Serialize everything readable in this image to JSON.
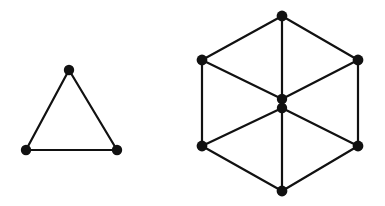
{
  "figure": {
    "background_color": "#ffffff",
    "stroke_color": "#111111",
    "edge_width": 2.2,
    "node_radius": 5.2,
    "width": 385,
    "height": 206
  },
  "graphs": [
    {
      "id": "triangle-graph",
      "name": "triangle",
      "vertex_count": 3,
      "edge_count": 3,
      "nodes": [
        {
          "id": "t-apex",
          "label": "apex",
          "x": 69,
          "y": 70,
          "r": 5.2
        },
        {
          "id": "t-bottom-left",
          "label": "bottom-left",
          "x": 26,
          "y": 150,
          "r": 5.2
        },
        {
          "id": "t-bottom-right",
          "label": "bottom-right",
          "x": 117,
          "y": 150,
          "r": 5.2
        }
      ],
      "edges": [
        {
          "id": "t-e1",
          "from": "t-apex",
          "to": "t-bottom-left",
          "x1": 69,
          "y1": 70,
          "x2": 26,
          "y2": 150
        },
        {
          "id": "t-e2",
          "from": "t-apex",
          "to": "t-bottom-right",
          "x1": 69,
          "y1": 70,
          "x2": 117,
          "y2": 150
        },
        {
          "id": "t-e3",
          "from": "t-bottom-left",
          "to": "t-bottom-right",
          "x1": 26,
          "y1": 150,
          "x2": 117,
          "y2": 150
        }
      ]
    },
    {
      "id": "hexagon-graph",
      "name": "hexagon-with-double-center",
      "vertex_count": 8,
      "edge_count": 13,
      "nodes": [
        {
          "id": "h-top",
          "label": "top",
          "x": 282,
          "y": 16,
          "r": 5.4
        },
        {
          "id": "h-upper-left",
          "label": "upper-left",
          "x": 202,
          "y": 60,
          "r": 5.4
        },
        {
          "id": "h-upper-right",
          "label": "upper-right",
          "x": 358,
          "y": 60,
          "r": 5.4
        },
        {
          "id": "h-center-upper",
          "label": "center-upper",
          "x": 282,
          "y": 99,
          "r": 5.2
        },
        {
          "id": "h-center-lower",
          "label": "center-lower",
          "x": 282,
          "y": 108,
          "r": 5.2
        },
        {
          "id": "h-lower-left",
          "label": "lower-left",
          "x": 202,
          "y": 146,
          "r": 5.4
        },
        {
          "id": "h-lower-right",
          "label": "lower-right",
          "x": 358,
          "y": 146,
          "r": 5.4
        },
        {
          "id": "h-bottom",
          "label": "bottom",
          "x": 282,
          "y": 191,
          "r": 5.4
        }
      ],
      "edges": [
        {
          "id": "h-e1",
          "from": "h-top",
          "to": "h-upper-left",
          "x1": 282,
          "y1": 16,
          "x2": 202,
          "y2": 60
        },
        {
          "id": "h-e2",
          "from": "h-top",
          "to": "h-upper-right",
          "x1": 282,
          "y1": 16,
          "x2": 358,
          "y2": 60
        },
        {
          "id": "h-e3",
          "from": "h-top",
          "to": "h-center-upper",
          "x1": 282,
          "y1": 16,
          "x2": 282,
          "y2": 99
        },
        {
          "id": "h-e4",
          "from": "h-upper-left",
          "to": "h-center-upper",
          "x1": 202,
          "y1": 60,
          "x2": 282,
          "y2": 99
        },
        {
          "id": "h-e5",
          "from": "h-upper-right",
          "to": "h-center-upper",
          "x1": 358,
          "y1": 60,
          "x2": 282,
          "y2": 99
        },
        {
          "id": "h-e6",
          "from": "h-upper-left",
          "to": "h-lower-left",
          "x1": 202,
          "y1": 60,
          "x2": 202,
          "y2": 146
        },
        {
          "id": "h-e7",
          "from": "h-upper-right",
          "to": "h-lower-right",
          "x1": 358,
          "y1": 60,
          "x2": 358,
          "y2": 146
        },
        {
          "id": "h-e8",
          "from": "h-center-upper",
          "to": "h-center-lower",
          "x1": 282,
          "y1": 99,
          "x2": 282,
          "y2": 108
        },
        {
          "id": "h-e9",
          "from": "h-center-lower",
          "to": "h-lower-left",
          "x1": 282,
          "y1": 108,
          "x2": 202,
          "y2": 146
        },
        {
          "id": "h-e10",
          "from": "h-center-lower",
          "to": "h-lower-right",
          "x1": 282,
          "y1": 108,
          "x2": 358,
          "y2": 146
        },
        {
          "id": "h-e11",
          "from": "h-center-lower",
          "to": "h-bottom",
          "x1": 282,
          "y1": 108,
          "x2": 282,
          "y2": 191
        },
        {
          "id": "h-e12",
          "from": "h-lower-left",
          "to": "h-bottom",
          "x1": 202,
          "y1": 146,
          "x2": 282,
          "y2": 191
        },
        {
          "id": "h-e13",
          "from": "h-lower-right",
          "to": "h-bottom",
          "x1": 358,
          "y1": 146,
          "x2": 282,
          "y2": 191
        }
      ]
    }
  ]
}
